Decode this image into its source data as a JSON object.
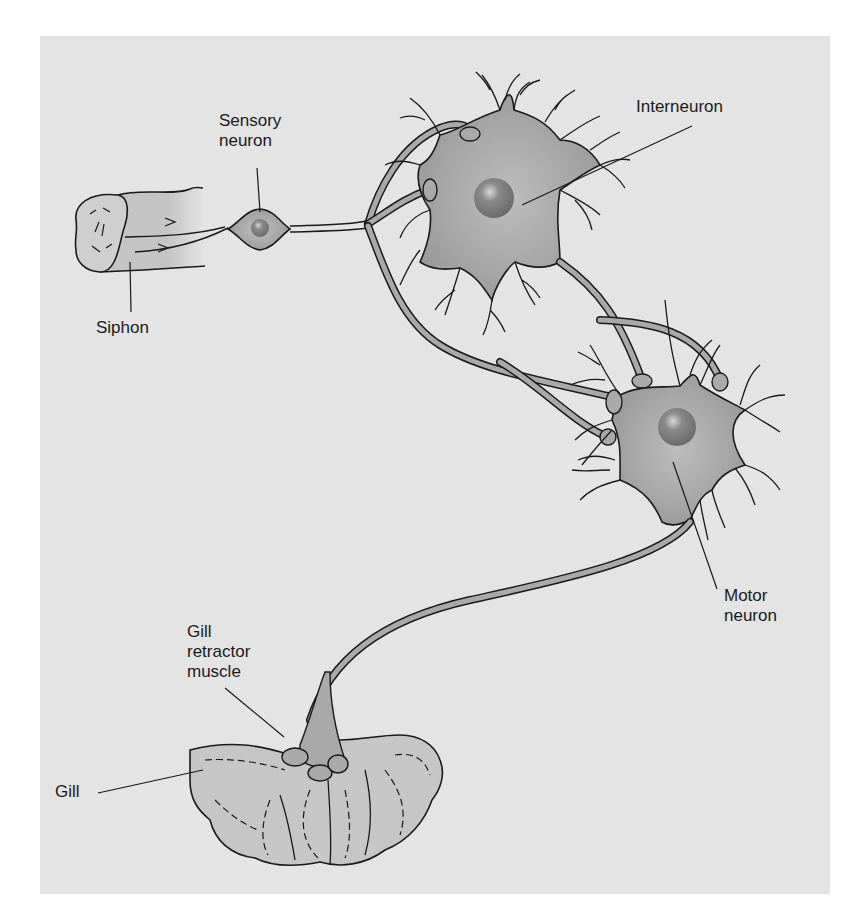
{
  "figure": {
    "background_color": "#e4e4e4",
    "neuron_fill": "#a9a9a9",
    "nucleus_fill": "#7d7d7d",
    "outline_color": "#1a1a1a"
  },
  "labels": {
    "sensory_neuron": "Sensory\nneuron",
    "interneuron": "Interneuron",
    "siphon": "Siphon",
    "motor_neuron": "Motor\nneuron",
    "gill_retractor_muscle": "Gill\nretractor\nmuscle",
    "gill": "Gill"
  },
  "components": [
    {
      "id": "siphon",
      "label": "Siphon"
    },
    {
      "id": "sensory-neuron",
      "label": "Sensory neuron"
    },
    {
      "id": "interneuron",
      "label": "Interneuron"
    },
    {
      "id": "motor-neuron",
      "label": "Motor neuron"
    },
    {
      "id": "gill-retractor-muscle",
      "label": "Gill retractor muscle"
    },
    {
      "id": "gill",
      "label": "Gill"
    }
  ]
}
